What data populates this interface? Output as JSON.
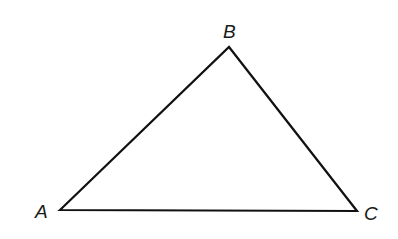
{
  "diagram": {
    "type": "triangle",
    "stroke_color": "#111111",
    "background": "#ffffff",
    "vertices": [
      {
        "label": "A",
        "x": 60,
        "y": 210
      },
      {
        "label": "B",
        "x": 229,
        "y": 47
      },
      {
        "label": "C",
        "x": 357,
        "y": 211
      }
    ],
    "labels": {
      "A": "A",
      "B": "B",
      "C": "C"
    }
  }
}
